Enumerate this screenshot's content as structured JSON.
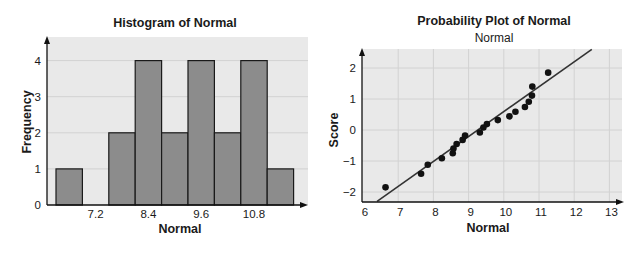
{
  "chart_data": [
    {
      "type": "bar",
      "subtype": "histogram",
      "title": "Histogram of Normal",
      "xlabel": "Normal",
      "ylabel": "Frequency",
      "bin_width": 0.6,
      "bin_midpoints": [
        6.6,
        7.2,
        7.8,
        8.4,
        9.0,
        9.6,
        10.2,
        10.8,
        11.4
      ],
      "values": [
        1,
        0,
        2,
        4,
        2,
        4,
        2,
        4,
        1
      ],
      "x_tick_labels": [
        "7.2",
        "8.4",
        "9.6",
        "10.8"
      ],
      "y_tick_labels": [
        "0",
        "1",
        "2",
        "3",
        "4"
      ],
      "ylim": [
        0,
        4.5
      ],
      "grid": true,
      "colors": {
        "bar": "#8c8c8c",
        "background": "#e9e9e9",
        "grid": "#d2d2d2"
      }
    },
    {
      "type": "scatter",
      "subtype": "normal-probability-plot",
      "title": "Probability Plot of Normal",
      "subtitle": "Normal",
      "xlabel": "Normal",
      "ylabel": "Score",
      "x_tick_labels": [
        "6",
        "7",
        "8",
        "9",
        "10",
        "11",
        "12",
        "13"
      ],
      "y_tick_labels": [
        "-2",
        "-1",
        "0",
        "1",
        "2"
      ],
      "xlim": [
        6,
        13.2
      ],
      "ylim": [
        -2.3,
        2.6
      ],
      "grid": true,
      "points": [
        [
          6.64,
          -1.85
        ],
        [
          7.65,
          -1.41
        ],
        [
          7.84,
          -1.12
        ],
        [
          8.24,
          -0.91
        ],
        [
          8.55,
          -0.75
        ],
        [
          8.57,
          -0.6
        ],
        [
          8.66,
          -0.45
        ],
        [
          8.83,
          -0.32
        ],
        [
          8.9,
          -0.18
        ],
        [
          9.32,
          -0.08
        ],
        [
          9.42,
          0.08
        ],
        [
          9.52,
          0.19
        ],
        [
          9.83,
          0.32
        ],
        [
          10.16,
          0.44
        ],
        [
          10.33,
          0.59
        ],
        [
          10.6,
          0.74
        ],
        [
          10.71,
          0.91
        ],
        [
          10.8,
          1.11
        ],
        [
          10.81,
          1.4
        ],
        [
          11.26,
          1.85
        ]
      ],
      "fit_line": {
        "x1": 6.4,
        "y1": -2.3,
        "x2": 12.5,
        "y2": 2.6
      },
      "colors": {
        "point": "#111111",
        "line": "#333333",
        "background": "#e9e9e9",
        "grid": "#d2d2d2"
      }
    }
  ]
}
